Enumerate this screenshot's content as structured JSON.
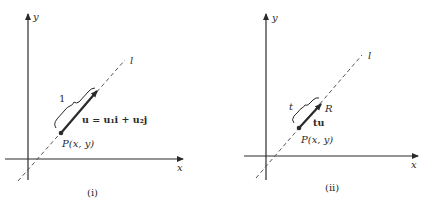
{
  "panels": [
    {
      "id": "i",
      "caption": "(i)",
      "x_axis_label": "x",
      "y_axis_label": "y",
      "line_label": "l",
      "point_label": "P(x, y)",
      "brace_label": "1",
      "vector_label": "u = u₁i + u₂j"
    },
    {
      "id": "ii",
      "caption": "(ii)",
      "x_axis_label": "x",
      "y_axis_label": "y",
      "line_label": "l",
      "point_label": "P(x, y)",
      "brace_label": "t",
      "vector_label": "tu",
      "endpoint_label": "R"
    }
  ],
  "colors": {
    "ink": "#2a2a2a",
    "dashed_line": "#555555"
  }
}
